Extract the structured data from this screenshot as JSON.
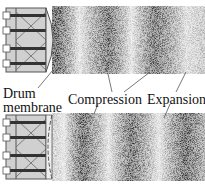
{
  "labels": {
    "drum": "Drum",
    "membrane": "membrane",
    "compression": "Compression",
    "expansion": "Expansion"
  },
  "panels": [
    {
      "name": "top",
      "membrane_state": "bulged-out",
      "dark_bands_x": [
        57,
        108,
        155
      ],
      "light_bands_x": [
        80,
        132,
        195
      ]
    },
    {
      "name": "bottom",
      "membrane_state": "pulled-in",
      "dark_bands_x": [
        82,
        132,
        185
      ],
      "light_bands_x": [
        60,
        108,
        160
      ]
    }
  ],
  "colors": {
    "frame": "#555555",
    "drum_fill": "#cfcfcf",
    "membrane": "#e4e4e4",
    "dark": "#111111"
  }
}
